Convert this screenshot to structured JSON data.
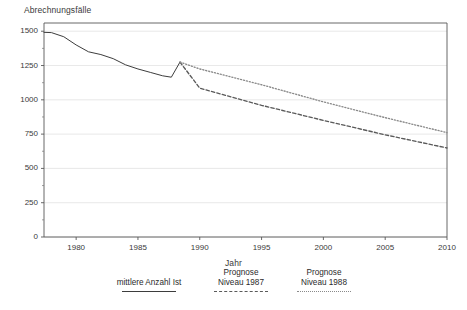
{
  "chart_data": {
    "type": "line",
    "title": "",
    "ylabel": "Abrechnungsfälle",
    "xlabel": "Jahr",
    "xlim": [
      1977.4,
      2010
    ],
    "ylim": [
      0,
      1560
    ],
    "grid": true,
    "legend_position": "bottom",
    "yticks": [
      "0",
      "250",
      "500",
      "750",
      "1000",
      "1250",
      "1500"
    ],
    "ytick_values": [
      0,
      250,
      500,
      750,
      1000,
      1250,
      1500
    ],
    "xticks": [
      "1980",
      "1985",
      "1990",
      "1995",
      "2000",
      "2005",
      "2010"
    ],
    "xtick_values": [
      1980,
      1985,
      1990,
      1995,
      2000,
      2005,
      2010
    ],
    "series": [
      {
        "name": "mittlere Anzahl Ist",
        "style": "solid",
        "color": "#3d3d3d",
        "x": [
          1977.4,
          1978.0,
          1979.0,
          1980.0,
          1981.0,
          1982.0,
          1983.0,
          1984.0,
          1985.0,
          1986.0,
          1987.0,
          1987.7,
          1988.4
        ],
        "values": [
          1492,
          1490,
          1460,
          1400,
          1350,
          1330,
          1300,
          1255,
          1225,
          1200,
          1175,
          1165,
          1275
        ]
      },
      {
        "name": "Prognose Niveau 1987",
        "style": "dashed",
        "color": "#5a5a5a",
        "x": [
          1988.4,
          1990.0,
          1995.0,
          2000.0,
          2005.0,
          2010.0
        ],
        "values": [
          1275,
          1085,
          960,
          850,
          745,
          649
        ]
      },
      {
        "name": "Prognose Niveau 1988",
        "style": "dotted",
        "color": "#8a8a8a",
        "x": [
          1988.4,
          1990.0,
          1995.0,
          2000.0,
          2005.0,
          2010.0
        ],
        "values": [
          1275,
          1225,
          1110,
          985,
          870,
          761
        ]
      }
    ]
  },
  "legend": {
    "entries": [
      {
        "label_line1": "mittlere Anzahl Ist",
        "label_line2": "",
        "style": "solid"
      },
      {
        "label_line1": "Prognose",
        "label_line2": "Niveau 1987",
        "style": "dashed"
      },
      {
        "label_line1": "Prognose",
        "label_line2": "Niveau 1988",
        "style": "dotted"
      }
    ]
  }
}
